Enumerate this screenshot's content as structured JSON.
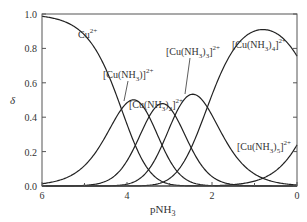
{
  "chart_data": {
    "type": "line",
    "title": "",
    "xlabel": "pNH3",
    "ylabel": "δ",
    "xlim": [
      6,
      0
    ],
    "ylim": [
      0,
      1.0
    ],
    "x_reversed": true,
    "grid": false,
    "x_ticks": [
      6,
      4,
      2,
      0
    ],
    "x_minor_ticks": [
      5,
      3,
      1
    ],
    "y_ticks": [
      0.0,
      0.2,
      0.4,
      0.6,
      0.8,
      1.0
    ],
    "y_tick_labels": [
      "0.0",
      "0.2",
      "0.4",
      "0.6",
      "0.8",
      "1.0"
    ],
    "log_beta": [
      4.13,
      7.61,
      10.48,
      12.59,
      12.09
    ],
    "series": [
      {
        "name": "Cu2+",
        "label": "Cu",
        "sup": "2+",
        "n": 0,
        "peak_x": 6.0,
        "peak_y": 0.98
      },
      {
        "name": "[Cu(NH3)]2+",
        "label": "[Cu(NH3)]",
        "sup": "2+",
        "n": 1,
        "peak_x": 4.05,
        "peak_y": 0.5
      },
      {
        "name": "[Cu(NH3)2]2+",
        "label": "[Cu(NH3)2]",
        "sup": "2+",
        "n": 2,
        "peak_x": 3.35,
        "peak_y": 0.48
      },
      {
        "name": "[Cu(NH3)3]2+",
        "label": "[Cu(NH3)3]",
        "sup": "2+",
        "n": 3,
        "peak_x": 2.65,
        "peak_y": 0.52
      },
      {
        "name": "[Cu(NH3)4]2+",
        "label": "[Cu(NH3)4]",
        "sup": "2+",
        "n": 4,
        "peak_x": 1.1,
        "peak_y": 0.92
      },
      {
        "name": "[Cu(NH3)5]2+",
        "label": "[Cu(NH3)5]",
        "sup": "2+",
        "n": 5,
        "peak_x": 0.0,
        "peak_y": 0.25
      }
    ],
    "annotations": [
      {
        "text": "Cu",
        "sub": "",
        "sup": "2+",
        "x": 78,
        "y": 38
      },
      {
        "text": "[Cu(NH",
        "sub": "3",
        "after": ")]",
        "sup": "2+",
        "x": 103,
        "y": 78,
        "leader": [
          [
            128,
            81
          ],
          [
            124,
            101
          ]
        ]
      },
      {
        "text": "[Cu(NH",
        "sub": "3",
        "after": ")",
        "sub2": "2",
        "after2": "]",
        "sup": "2+",
        "x": 129,
        "y": 108,
        "leader": null
      },
      {
        "text": "[Cu(NH",
        "sub": "3",
        "after": ")",
        "sub2": "3",
        "after2": "]",
        "sup": "2+",
        "x": 166,
        "y": 55,
        "leader": [
          [
            190,
            58
          ],
          [
            185,
            94
          ]
        ]
      },
      {
        "text": "[Cu(NH",
        "sub": "3",
        "after": ")",
        "sub2": "4",
        "after2": "]",
        "sup": "2+",
        "x": 232,
        "y": 48,
        "leader": null
      },
      {
        "text": "[Cu(NH",
        "sub": "3",
        "after": ")",
        "sub2": "5",
        "after2": "]",
        "sup": "2+",
        "x": 237,
        "y": 150,
        "leader": null
      }
    ]
  }
}
